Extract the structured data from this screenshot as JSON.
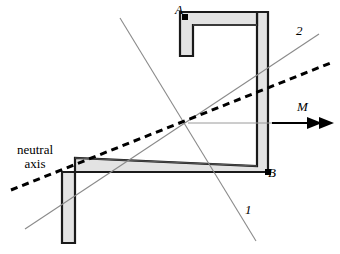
{
  "figure": {
    "kind": "engineering-cross-section-diagram",
    "width": 340,
    "height": 254,
    "background_color": "#ffffff"
  },
  "labels": {
    "point_a": "A",
    "point_b": "B",
    "axis_1": "1",
    "axis_2": "2",
    "moment": "M",
    "neutral_axis_line1": "neutral",
    "neutral_axis_line2": "axis"
  },
  "colors": {
    "section_fill": "#e3e3e3",
    "section_outline": "#1a1a1a",
    "section_inner_outline": "#3a3a3a",
    "axis_line": "#8a8a8a",
    "neutral_axis": "#000000",
    "moment_arrow": "#000000",
    "reference_line": "#9a9a9a",
    "point_marker": "#000000",
    "label_text": "#000000"
  },
  "geometry": {
    "centroid": {
      "x": 188,
      "y": 123
    },
    "section_outer_path": "M 180,12 L 268,12 L 268,172 L 62,172 L 62,243 L 75,243 L 75,158 L 257,166 L 257,12 Z",
    "section_outer_points": [
      {
        "x": 180,
        "y": 12
      },
      {
        "x": 268,
        "y": 12
      },
      {
        "x": 268,
        "y": 172
      },
      {
        "x": 62,
        "y": 172
      },
      {
        "x": 62,
        "y": 243
      },
      {
        "x": 75,
        "y": 243
      },
      {
        "x": 75,
        "y": 158
      },
      {
        "x": 257,
        "y": 166
      },
      {
        "x": 257,
        "y": 12
      }
    ],
    "notch_path": "M 180,12 L 180,56 L 193,56 L 193,25 L 257,25 L 257,12 Z",
    "wall_thickness": 13,
    "point_a_marker": {
      "x": 182,
      "y": 14
    },
    "point_b_marker": {
      "x": 265,
      "y": 169
    },
    "axis_1_line": {
      "x1": 120,
      "y1": 18,
      "x2": 256,
      "y2": 241
    },
    "axis_2_line": {
      "x1": 25,
      "y1": 229,
      "x2": 319,
      "y2": 34
    },
    "neutral_axis_line": {
      "x1": 11,
      "y1": 190,
      "x2": 333,
      "y2": 62
    },
    "neutral_axis_dash": "7 5",
    "neutral_axis_width": 3,
    "reference_line": {
      "x1": 188,
      "y1": 123,
      "x2": 288,
      "y2": 123
    },
    "moment_arrow": {
      "x1": 272,
      "y1": 123,
      "x2": 334,
      "y2": 123
    }
  }
}
